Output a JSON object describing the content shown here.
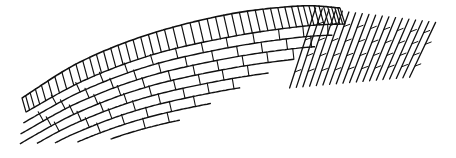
{
  "image": {
    "width": 456,
    "height": 158,
    "background": "#ffffff",
    "stroke_color": "#111111",
    "subject": "curved brick masonry line drawing"
  },
  "illustration": {
    "soldier_course": {
      "outer_curve": [
        [
          22,
          98
        ],
        [
          80,
          62
        ],
        [
          150,
          34
        ],
        [
          230,
          14
        ],
        [
          300,
          6
        ],
        [
          340,
          8
        ]
      ],
      "inner_curve": [
        [
          26,
          112
        ],
        [
          85,
          80
        ],
        [
          155,
          54
        ],
        [
          235,
          36
        ],
        [
          305,
          26
        ],
        [
          345,
          24
        ]
      ],
      "divisions": 48
    },
    "stretcher_courses": {
      "count": 8,
      "spacing": 11,
      "brick_length": 24,
      "start_t": 0.0
    },
    "diagonal_field": {
      "x_start": 300,
      "x_end": 420,
      "y_top": 8,
      "y_bottom": 88,
      "line_count": 18,
      "slant": 26
    },
    "bottom_edge": [
      [
        18,
        142
      ],
      [
        90,
        140
      ],
      [
        170,
        130
      ],
      [
        250,
        108
      ],
      [
        300,
        90
      ],
      [
        330,
        82
      ],
      [
        420,
        80
      ]
    ]
  }
}
